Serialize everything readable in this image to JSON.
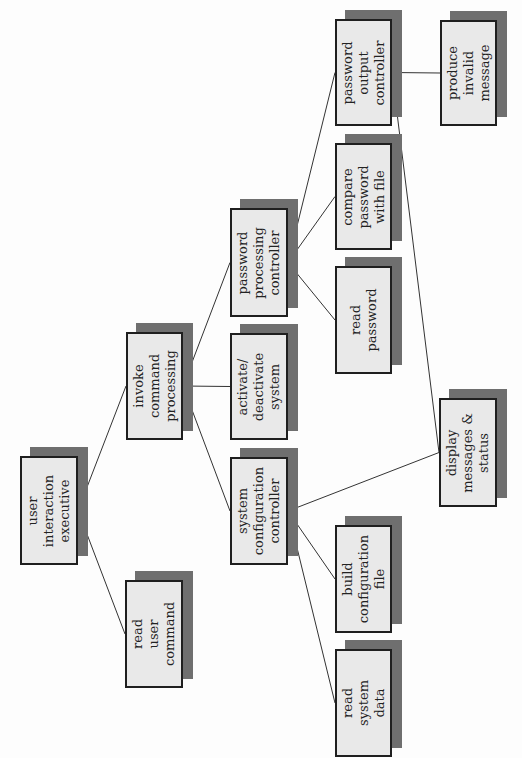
{
  "diagram": {
    "type": "structure-chart",
    "orientation": "rotated-90-ccw",
    "colors": {
      "box_fill": "#e9e9e9",
      "box_border": "#1f1f1f",
      "shadow": "#6f6f6f",
      "line": "#333333"
    },
    "nodes": [
      {
        "id": "user_interaction_executive",
        "lines": [
          "user",
          "interaction",
          "executive"
        ],
        "x": 20,
        "y": 456,
        "w": 58,
        "h": 109
      },
      {
        "id": "read_user_command",
        "lines": [
          "read",
          "user",
          "command"
        ],
        "x": 125,
        "y": 580,
        "w": 58,
        "h": 108
      },
      {
        "id": "invoke_command_processing",
        "lines": [
          "invoke",
          "command",
          "processing"
        ],
        "x": 126,
        "y": 332,
        "w": 57,
        "h": 108
      },
      {
        "id": "password_processing_controller",
        "lines": [
          "password",
          "processing",
          "controller"
        ],
        "x": 230,
        "y": 208,
        "w": 58,
        "h": 109
      },
      {
        "id": "activate_deactivate_system",
        "lines": [
          "activate/",
          "deactivate",
          "system"
        ],
        "x": 230,
        "y": 333,
        "w": 58,
        "h": 107
      },
      {
        "id": "system_configuration_controller",
        "lines": [
          "system",
          "configuration",
          "controller"
        ],
        "x": 230,
        "y": 457,
        "w": 58,
        "h": 108
      },
      {
        "id": "password_output_controller",
        "lines": [
          "password",
          "output",
          "controller"
        ],
        "x": 335,
        "y": 19,
        "w": 57,
        "h": 107
      },
      {
        "id": "compare_password_with_file",
        "lines": [
          "compare",
          "password",
          "with file"
        ],
        "x": 335,
        "y": 143,
        "w": 57,
        "h": 107
      },
      {
        "id": "read_password",
        "lines": [
          "read",
          "password"
        ],
        "x": 335,
        "y": 266,
        "w": 57,
        "h": 108
      },
      {
        "id": "build_configuration_file",
        "lines": [
          "build",
          "configuration",
          "file"
        ],
        "x": 335,
        "y": 525,
        "w": 57,
        "h": 108
      },
      {
        "id": "read_system_data",
        "lines": [
          "read",
          "system",
          "data"
        ],
        "x": 335,
        "y": 649,
        "w": 57,
        "h": 108
      },
      {
        "id": "produce_invalid_message",
        "lines": [
          "produce",
          "invalid",
          "message"
        ],
        "x": 440,
        "y": 20,
        "w": 57,
        "h": 106
      },
      {
        "id": "display_messages_status",
        "lines": [
          "display",
          "messages &",
          "status"
        ],
        "x": 439,
        "y": 398,
        "w": 58,
        "h": 109
      }
    ],
    "edges": [
      {
        "from": "user_interaction_executive",
        "to": "invoke_command_processing"
      },
      {
        "from": "user_interaction_executive",
        "to": "read_user_command"
      },
      {
        "from": "invoke_command_processing",
        "to": "password_processing_controller"
      },
      {
        "from": "invoke_command_processing",
        "to": "activate_deactivate_system"
      },
      {
        "from": "invoke_command_processing",
        "to": "system_configuration_controller"
      },
      {
        "from": "password_processing_controller",
        "to": "password_output_controller"
      },
      {
        "from": "password_processing_controller",
        "to": "compare_password_with_file"
      },
      {
        "from": "password_processing_controller",
        "to": "read_password"
      },
      {
        "from": "password_output_controller",
        "to": "produce_invalid_message"
      },
      {
        "from": "password_output_controller",
        "to": "display_messages_status"
      },
      {
        "from": "system_configuration_controller",
        "to": "display_messages_status"
      },
      {
        "from": "system_configuration_controller",
        "to": "build_configuration_file"
      },
      {
        "from": "system_configuration_controller",
        "to": "read_system_data"
      }
    ]
  }
}
